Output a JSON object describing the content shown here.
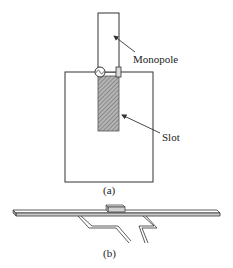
{
  "figure_a": {
    "labels": {
      "monopole": "Monopole",
      "slot": "Slot",
      "caption": "(a)"
    },
    "icons": {
      "source": "ac-source-icon"
    }
  },
  "figure_b": {
    "caption": "(b)"
  },
  "colors": {
    "line": "#333333",
    "hatch": "#8a8a8a",
    "background": "#ffffff"
  }
}
